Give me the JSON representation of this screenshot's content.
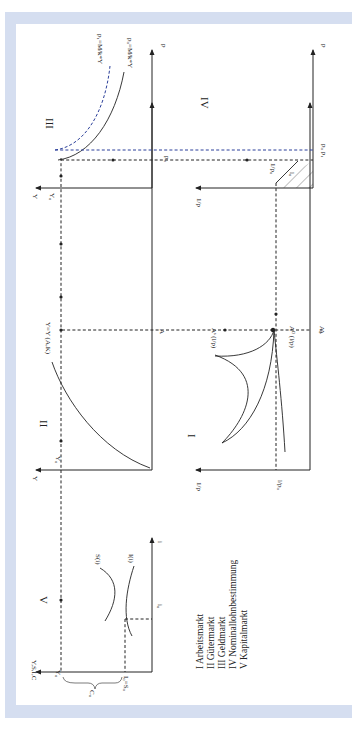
{
  "colors": {
    "frame": "#d5def0",
    "page": "#ffffff",
    "ink": "#222222",
    "shift_blue": "#2b3f9a"
  },
  "panels": {
    "III": {
      "numeral": "III",
      "curve0": "p₀=M/k*Y",
      "curve1": "p₁=M/k*Y",
      "x_axis": "Y",
      "y_axis": "p",
      "y0": "Y₀",
      "p0": "p₀"
    },
    "IV": {
      "numeral": "IV",
      "x_axis": "1/p",
      "y_axis": "p",
      "p_labels": "p₀  p₁",
      "point": "1/p₀",
      "area": "l₀"
    },
    "II": {
      "numeral": "II",
      "curve": "Y=Y (A,K)",
      "x_axis": "Y",
      "y_axis": "A",
      "y0": "Y₀"
    },
    "I": {
      "numeral": "I",
      "supply": "Aˢ (l/p)",
      "demand": "Aᴰ (l/p)",
      "x_axis": "1/p",
      "y_axis": "A",
      "a0": "A₀",
      "w0": "l/p₀"
    },
    "V": {
      "numeral": "V",
      "saving": "S(i)",
      "investment": "I(i)",
      "x_axis": "Y,S,I,C",
      "y_axis": "i",
      "y0": "Y₀",
      "i0": "i₀",
      "is0": "I₀=S₀",
      "c0": "C₀"
    }
  },
  "legend": [
    "I   Arbeitsmarkt",
    "II  Gütermarkt",
    "III Geldmarkt",
    "IV Nominallohnbestimmung",
    "V   Kapitalmarkt"
  ]
}
